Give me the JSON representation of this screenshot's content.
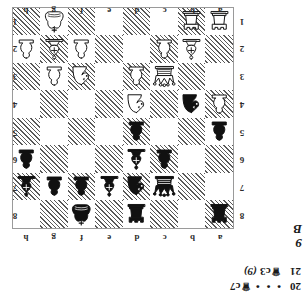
{
  "diagram": {
    "number": "9",
    "side_to_move": "B",
    "files_top": [
      "a",
      "b",
      "c",
      "d",
      "e",
      "f",
      "g",
      "h"
    ],
    "files_bottom": [
      "a",
      "b",
      "c",
      "d",
      "e",
      "f",
      "g",
      "h"
    ],
    "ranks_left": [
      "8",
      "7",
      "6",
      "5",
      "4",
      "3",
      "2",
      "1"
    ],
    "ranks_right": [
      "8",
      "7",
      "6",
      "5",
      "4",
      "3",
      "2",
      "1"
    ],
    "light_square_color": "#ffffff",
    "dark_square_color": "#595959",
    "border_color": "#9a9a9a"
  },
  "position": {
    "fen": "r3r1k1/2qnbppb/2pb3p/p2p4/Pn1N4/2Q2NP1/1BP2PBP/R1R3K1",
    "ranks": [
      [
        "br",
        "",
        "",
        "br",
        "",
        "bk",
        "",
        ""
      ],
      [
        "",
        "",
        "bq",
        "bn",
        "bb",
        "bp",
        "bp",
        "bb"
      ],
      [
        "",
        "",
        "bp",
        "bb",
        "",
        "",
        "",
        "bp"
      ],
      [
        "bp",
        "",
        "",
        "bp",
        "",
        "",
        "",
        ""
      ],
      [
        "wp",
        "bn",
        "",
        "wn",
        "",
        "",
        "",
        ""
      ],
      [
        "",
        "",
        "wq",
        "wp",
        "",
        "wn",
        "wp",
        ""
      ],
      [
        "",
        "wb",
        "wp",
        "",
        "",
        "wp",
        "wb",
        "wp"
      ],
      [
        "wr",
        "wr",
        "",
        "",
        "",
        "",
        "wk",
        ""
      ]
    ]
  },
  "moves": [
    {
      "number": "20",
      "body": "…",
      "piece": "",
      "square": "c7",
      "eval": ""
    },
    {
      "number": "21",
      "body": "",
      "piece": "queen",
      "square": "c3",
      "eval": "(9)"
    }
  ],
  "move_lines": {
    "line1_number": "20",
    "line1_ellipsis": "• • •",
    "line1_move": "c7",
    "line2_number": "21",
    "line2_move": "c3",
    "line2_eval": "(9)"
  }
}
